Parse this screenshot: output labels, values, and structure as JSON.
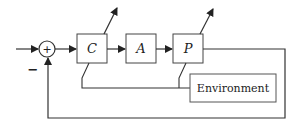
{
  "diagram": {
    "type": "block-diagram",
    "summing_junction": {
      "symbol": "+",
      "feedback_sign": "−"
    },
    "blocks": [
      {
        "id": "C",
        "label": "C"
      },
      {
        "id": "A",
        "label": "A"
      },
      {
        "id": "P",
        "label": "P"
      },
      {
        "id": "environment",
        "label": "Environment"
      }
    ],
    "connections": [
      {
        "from": "input",
        "to": "summing_junction"
      },
      {
        "from": "summing_junction",
        "to": "C"
      },
      {
        "from": "C",
        "to": "A"
      },
      {
        "from": "A",
        "to": "P"
      },
      {
        "from": "P",
        "to": "summing_junction",
        "sign": "−",
        "kind": "feedback"
      },
      {
        "from": "environment",
        "to": "C",
        "kind": "disturbance-link"
      },
      {
        "from": "environment",
        "to": "P",
        "kind": "disturbance-link"
      }
    ],
    "adjustable_blocks": [
      "C",
      "P"
    ],
    "colors": {
      "line": "#333333",
      "box_fill": "#ffffff"
    }
  }
}
